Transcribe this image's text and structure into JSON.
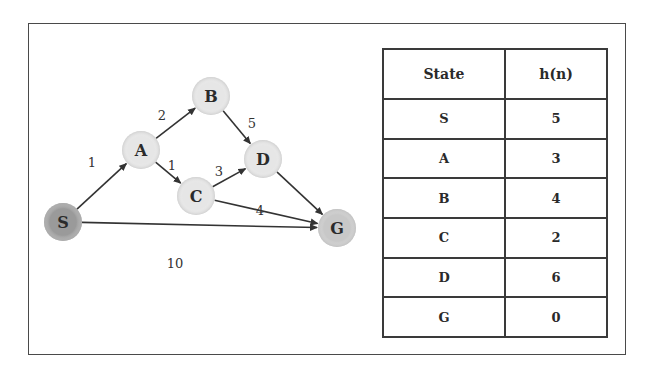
{
  "graph": {
    "nodes": [
      {
        "id": "S",
        "label": "S",
        "x": 63,
        "y": 222,
        "fill": "#9a9a9a"
      },
      {
        "id": "A",
        "label": "A",
        "x": 141,
        "y": 150,
        "fill": "#e6e6e6"
      },
      {
        "id": "B",
        "label": "B",
        "x": 211,
        "y": 96,
        "fill": "#e6e6e6"
      },
      {
        "id": "C",
        "label": "C",
        "x": 196,
        "y": 196,
        "fill": "#e6e6e6"
      },
      {
        "id": "D",
        "label": "D",
        "x": 263,
        "y": 159,
        "fill": "#e6e6e6"
      },
      {
        "id": "G",
        "label": "G",
        "x": 337,
        "y": 228,
        "fill": "#c8c8c8"
      }
    ],
    "edges": [
      {
        "from": "S",
        "to": "A",
        "weight": "1",
        "lx": 92,
        "ly": 167
      },
      {
        "from": "A",
        "to": "B",
        "weight": "2",
        "lx": 162,
        "ly": 120
      },
      {
        "from": "A",
        "to": "C",
        "weight": "1",
        "lx": 172,
        "ly": 170
      },
      {
        "from": "B",
        "to": "D",
        "weight": "5",
        "lx": 252,
        "ly": 128
      },
      {
        "from": "C",
        "to": "D",
        "weight": "3",
        "lx": 219,
        "ly": 176
      },
      {
        "from": "C",
        "to": "G",
        "weight": "4",
        "lx": 260,
        "ly": 215
      },
      {
        "from": "D",
        "to": "G",
        "weight": "",
        "lx": 0,
        "ly": 0
      },
      {
        "from": "S",
        "to": "G",
        "weight": "10",
        "lx": 175,
        "ly": 268
      }
    ]
  },
  "table": {
    "headers": [
      "State",
      "h(n)"
    ],
    "rows": [
      [
        "S",
        "5"
      ],
      [
        "A",
        "3"
      ],
      [
        "B",
        "4"
      ],
      [
        "C",
        "2"
      ],
      [
        "D",
        "6"
      ],
      [
        "G",
        "0"
      ]
    ]
  }
}
